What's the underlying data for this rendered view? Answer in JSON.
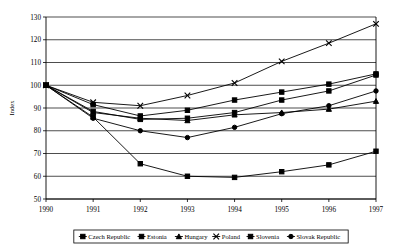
{
  "chart_data": {
    "type": "line",
    "title": "",
    "xlabel": "",
    "ylabel": "Index",
    "x": [
      1990,
      1991,
      1992,
      1993,
      1994,
      1995,
      1996,
      1997
    ],
    "categories": [
      "1990",
      "1991",
      "1992",
      "1993",
      "1994",
      "1995",
      "1996",
      "1997"
    ],
    "xlim": [
      1990,
      1997
    ],
    "ylim": [
      50,
      130
    ],
    "yticks": [
      50,
      60,
      70,
      80,
      90,
      100,
      110,
      120,
      130
    ],
    "ytick_labels": [
      "50",
      "60",
      "70",
      "80",
      "90",
      "100",
      "110",
      "120",
      "130"
    ],
    "grid": true,
    "legend_position": "bottom",
    "series": [
      {
        "name": "Czech Republic",
        "marker": "square",
        "values": [
          100,
          88.5,
          85.0,
          85.5,
          88.0,
          93.5,
          97.5,
          104.5
        ]
      },
      {
        "name": "Estonia",
        "marker": "square",
        "values": [
          100,
          86.0,
          65.5,
          60.0,
          59.5,
          62.0,
          65.0,
          71.0
        ]
      },
      {
        "name": "Hungary",
        "marker": "triangle",
        "values": [
          100,
          88.0,
          85.5,
          84.5,
          87.0,
          88.0,
          89.5,
          93.0
        ]
      },
      {
        "name": "Poland",
        "marker": "cross",
        "values": [
          100,
          92.5,
          91.0,
          95.5,
          101.0,
          110.5,
          118.5,
          127.0
        ]
      },
      {
        "name": "Slovenia",
        "marker": "square",
        "values": [
          100,
          91.5,
          86.5,
          89.0,
          93.5,
          97.0,
          100.5,
          105.0
        ]
      },
      {
        "name": "Slovak Republic",
        "marker": "circle",
        "values": [
          100,
          85.5,
          80.0,
          77.0,
          81.5,
          87.5,
          91.0,
          97.5
        ]
      }
    ]
  }
}
